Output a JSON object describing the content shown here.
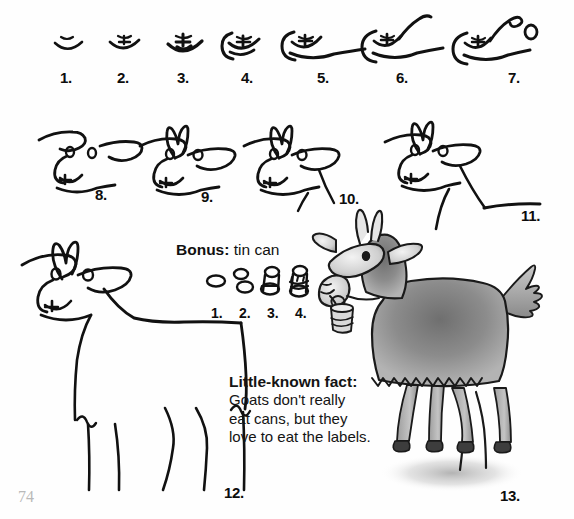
{
  "page": {
    "page_number": "74",
    "background_color": "#fefefe",
    "ink_color": "#111111",
    "page_number_color": "#b9b9b9",
    "width": 574,
    "height": 519
  },
  "steps": [
    {
      "label": "1.",
      "x": 60,
      "y": 69
    },
    {
      "label": "2.",
      "x": 117,
      "y": 69
    },
    {
      "label": "3.",
      "x": 177,
      "y": 69
    },
    {
      "label": "4.",
      "x": 241,
      "y": 69
    },
    {
      "label": "5.",
      "x": 317,
      "y": 69
    },
    {
      "label": "6.",
      "x": 396,
      "y": 69
    },
    {
      "label": "7.",
      "x": 508,
      "y": 69
    },
    {
      "label": "8.",
      "x": 95,
      "y": 186
    },
    {
      "label": "9.",
      "x": 201,
      "y": 188
    },
    {
      "label": "10.",
      "x": 339,
      "y": 190
    },
    {
      "label": "11.",
      "x": 521,
      "y": 207
    },
    {
      "label": "12.",
      "x": 224,
      "y": 484
    },
    {
      "label": "13.",
      "x": 500,
      "y": 487
    }
  ],
  "bonus": {
    "title": "Bonus:",
    "subject": "tin can",
    "steps": [
      {
        "label": "1.",
        "x": 211,
        "y": 305
      },
      {
        "label": "2.",
        "x": 239,
        "y": 305
      },
      {
        "label": "3.",
        "x": 267,
        "y": 305
      },
      {
        "label": "4.",
        "x": 295,
        "y": 305
      }
    ]
  },
  "fact": {
    "title": "Little-known fact:",
    "lines": [
      "Goats don't really",
      "eat cans, but they",
      "love to eat the labels."
    ]
  }
}
